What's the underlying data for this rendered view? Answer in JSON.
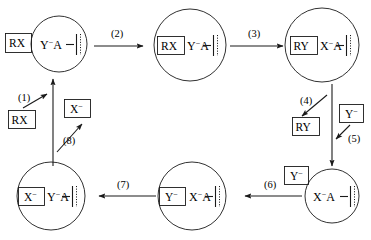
{
  "diagram": {
    "type": "cycle-diagram",
    "colors": {
      "stroke": "#1a1a1a",
      "background": "#ffffff",
      "text": "#000000"
    },
    "nodes": [
      {
        "id": "node-1",
        "shape": "circle",
        "position": "top-left",
        "boxed_label": "",
        "content": "Y",
        "content_charge": "−",
        "content_tail": "A",
        "full_text": "Y−A—"
      },
      {
        "id": "node-2",
        "shape": "circle",
        "position": "top-center",
        "boxed_label": "RX",
        "content": "Y",
        "content_charge": "−",
        "content_tail": "A",
        "full_text": "RX Y−A—"
      },
      {
        "id": "node-3",
        "shape": "circle",
        "position": "top-right",
        "boxed_label": "RY",
        "content": "X",
        "content_charge": "−",
        "content_tail": "A",
        "full_text": "RY X−A—"
      },
      {
        "id": "node-4",
        "shape": "circle",
        "position": "bottom-right",
        "boxed_label": "",
        "content": "X",
        "content_charge": "−",
        "content_tail": "A",
        "full_text": "X−A—"
      },
      {
        "id": "node-5",
        "shape": "circle",
        "position": "bottom-center",
        "boxed_label": "Y",
        "boxed_label_charge": "−",
        "content": "X",
        "content_charge": "−",
        "content_tail": "A",
        "full_text": "Y− X−A—"
      },
      {
        "id": "node-6",
        "shape": "circle",
        "position": "bottom-left",
        "boxed_label": "X",
        "boxed_label_charge": "−",
        "content": "Y",
        "content_charge": "−",
        "content_tail": "A",
        "full_text": "X− Y−A—"
      }
    ],
    "reagent_boxes": [
      {
        "id": "reagent-rx-left-outer",
        "label": "RX",
        "charge": "",
        "position": "left-of-top-left-circle"
      },
      {
        "id": "reagent-rx-lower-left",
        "label": "RX",
        "charge": "",
        "position": "left-middle"
      },
      {
        "id": "reagent-x-minus-left",
        "label": "X",
        "charge": "−",
        "position": "left-middle-right"
      },
      {
        "id": "reagent-ry-right",
        "label": "RY",
        "charge": "",
        "position": "right-middle-left"
      },
      {
        "id": "reagent-y-minus-right",
        "label": "Y",
        "charge": "−",
        "position": "right-middle-right"
      },
      {
        "id": "reagent-y-minus-bottom",
        "label": "Y",
        "charge": "−",
        "position": "above-bottom-right-circle"
      }
    ],
    "steps": [
      {
        "id": "step-1",
        "label": "(1)",
        "direction": "up-right",
        "note": "RX enters"
      },
      {
        "id": "step-2",
        "label": "(2)",
        "direction": "right",
        "note": "top-left to top-center"
      },
      {
        "id": "step-3",
        "label": "(3)",
        "direction": "right",
        "note": "top-center to top-right"
      },
      {
        "id": "step-4",
        "label": "(4)",
        "direction": "down-left",
        "note": "RY leaves"
      },
      {
        "id": "step-5",
        "label": "(5)",
        "direction": "down-left",
        "note": "Y- enters"
      },
      {
        "id": "step-6",
        "label": "(6)",
        "direction": "left",
        "note": "bottom-right to bottom-center"
      },
      {
        "id": "step-7",
        "label": "(7)",
        "direction": "left",
        "note": "bottom-center to bottom-left"
      },
      {
        "id": "step-8",
        "label": "(8)",
        "direction": "up-right",
        "note": "X- leaves"
      }
    ]
  }
}
